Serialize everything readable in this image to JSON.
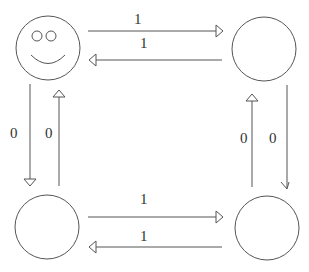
{
  "diagram": {
    "type": "state-transition",
    "states": [
      {
        "id": "top-left",
        "face": "smiley"
      },
      {
        "id": "top-right",
        "face": "none"
      },
      {
        "id": "bottom-left",
        "face": "none"
      },
      {
        "id": "bottom-right",
        "face": "none"
      }
    ],
    "transitions": [
      {
        "from": "top-left",
        "to": "top-right",
        "label": "1"
      },
      {
        "from": "top-right",
        "to": "top-left",
        "label": "1"
      },
      {
        "from": "top-left",
        "to": "bottom-left",
        "label": "0"
      },
      {
        "from": "bottom-left",
        "to": "top-left",
        "label": "0"
      },
      {
        "from": "bottom-right",
        "to": "top-right",
        "label": "0"
      },
      {
        "from": "top-right",
        "to": "bottom-right",
        "label": "0"
      },
      {
        "from": "bottom-left",
        "to": "bottom-right",
        "label": "1"
      },
      {
        "from": "bottom-right",
        "to": "bottom-left",
        "label": "1"
      }
    ],
    "colors": {
      "stroke": "#555555",
      "background": "#ffffff"
    }
  }
}
